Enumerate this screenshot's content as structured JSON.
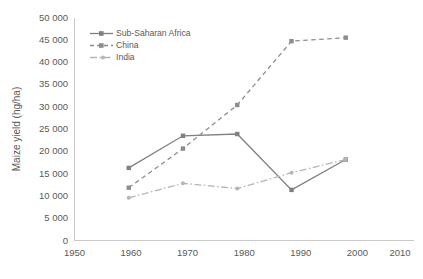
{
  "chart_data": {
    "type": "line",
    "title": "",
    "xlabel": "",
    "ylabel": "Maize yield (hg/ha)",
    "xlim": [
      1950,
      2010
    ],
    "ylim": [
      0,
      50000
    ],
    "grid": false,
    "legend_position": "top-left",
    "x": [
      1960,
      1970,
      1980,
      1990,
      2000
    ],
    "xticks": [
      "1950",
      "1960",
      "1970",
      "1980",
      "1990",
      "2000",
      "2010"
    ],
    "xtick_values": [
      1950,
      1960,
      1970,
      1980,
      1990,
      2000,
      2010
    ],
    "yticks": [
      "0",
      "5 000",
      "10 000",
      "15 000",
      "20 000",
      "25 000",
      "30 000",
      "35 000",
      "40 000",
      "45 000",
      "50 000"
    ],
    "ytick_values": [
      0,
      5000,
      10000,
      15000,
      20000,
      25000,
      30000,
      35000,
      40000,
      45000,
      50000
    ],
    "series": [
      {
        "name": "Sub-Saharan Africa",
        "values": [
          16500,
          23800,
          24200,
          11500,
          18400
        ],
        "color": "#808080",
        "dash": "none",
        "marker": "square"
      },
      {
        "name": "China",
        "values": [
          12000,
          20900,
          30800,
          45300,
          46100
        ],
        "color": "#8c8c8c",
        "dash": "dashed",
        "marker": "square"
      },
      {
        "name": "India",
        "values": [
          9700,
          13000,
          11800,
          15400,
          18400
        ],
        "color": "#b5b5b5",
        "dash": "dashdot",
        "marker": "circle"
      }
    ]
  },
  "legend": {
    "items": [
      {
        "label": "Sub-Saharan Africa"
      },
      {
        "label": "China"
      },
      {
        "label": "India"
      }
    ]
  },
  "axes": {
    "y_title": "Maize yield (hg/ha)"
  },
  "colors": {
    "axis": "#c9c9c9",
    "text": "#5a5a5a",
    "series_1": "#808080",
    "series_2": "#8c8c8c",
    "series_3": "#b5b5b5"
  }
}
